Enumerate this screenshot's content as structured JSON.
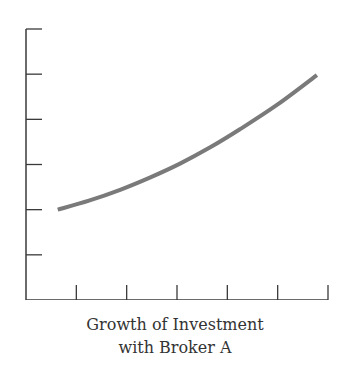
{
  "chart_data": {
    "type": "line",
    "title_lines": [
      "Growth of Investment",
      "with Broker A"
    ],
    "xlabel": "",
    "ylabel": "",
    "xlim": [
      0,
      6
    ],
    "ylim": [
      0,
      6
    ],
    "x_ticks": [
      1,
      2,
      3,
      4,
      5,
      6
    ],
    "y_ticks": [
      1,
      2,
      3,
      4,
      5,
      6
    ],
    "x_tick_labels": [],
    "y_tick_labels": [],
    "grid": false,
    "legend": null,
    "series": [
      {
        "name": "Broker A",
        "color": "#7a7a7a",
        "x": [
          0.63,
          1.25,
          1.87,
          2.46,
          3.06,
          3.66,
          4.25,
          5.0,
          5.78
        ],
        "values": [
          2.0,
          2.2,
          2.44,
          2.71,
          3.02,
          3.38,
          3.78,
          4.33,
          4.98
        ]
      }
    ]
  },
  "colors": {
    "axis": "#3a3a3a",
    "line": "#7a7a7a",
    "text": "#333333"
  }
}
